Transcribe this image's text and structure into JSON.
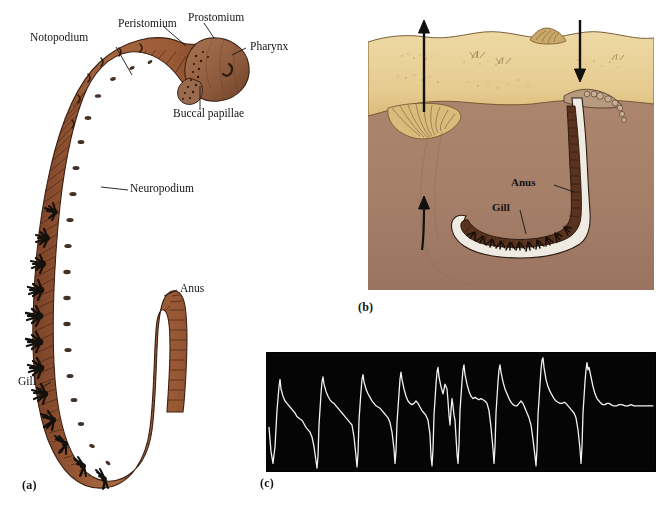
{
  "figure": {
    "background_color": "#ffffff"
  },
  "colors": {
    "worm_body": "#96583a",
    "worm_body_dark": "#6d3c25",
    "worm_body_light": "#b07a55",
    "head_brown": "#9a6a4e",
    "gill_black": "#14100c",
    "sand": "#e8cf96",
    "sand_dark": "#cdae70",
    "subsoil": "#a9826c",
    "subsoil_dark": "#8d6a57",
    "burrow_white": "#efeae2",
    "ink": "#141414",
    "scope_background": "#050505",
    "scope_trace": "#f2f2f2"
  },
  "panel_a": {
    "label": "(a)",
    "callouts": [
      {
        "name": "notopodium",
        "text": "Notopodium"
      },
      {
        "name": "peristomium",
        "text": "Peristomium"
      },
      {
        "name": "prostomium",
        "text": "Prostomium"
      },
      {
        "name": "pharynx",
        "text": "Pharynx"
      },
      {
        "name": "buccal-papillae",
        "text": "Buccal papillae"
      },
      {
        "name": "neuropodium",
        "text": "Neuropodium"
      },
      {
        "name": "anus",
        "text": "Anus"
      },
      {
        "name": "gill",
        "text": "Gill"
      }
    ]
  },
  "panel_b": {
    "label": "(b)",
    "callouts": [
      {
        "name": "anus",
        "text": "Anus"
      },
      {
        "name": "gill",
        "text": "Gill"
      }
    ],
    "arrows": [
      {
        "name": "water-out-arrow",
        "direction": "up",
        "description": "water expelled at tail shaft"
      },
      {
        "name": "water-in-arrow",
        "direction": "down",
        "description": "water drawn down head shaft"
      },
      {
        "name": "burrow-flow-arrow",
        "direction": "up",
        "description": "flow through sediment"
      }
    ],
    "surface_features": [
      {
        "name": "feeding-funnel",
        "text": ""
      },
      {
        "name": "faecal-cast",
        "text": ""
      }
    ]
  },
  "panel_c": {
    "label": "(c)",
    "description": "Oscilloscope recording of rhythmic irrigation pressure pulses"
  },
  "chart_data": {
    "type": "line",
    "title": "",
    "xlabel": "",
    "ylabel": "",
    "grid": false,
    "legend": null,
    "xlim": [
      0,
      390
    ],
    "ylim": [
      0,
      100
    ],
    "series": [
      {
        "name": "irrigation-pressure-trace",
        "color": "#f2f2f2",
        "points": [
          [
            2,
            38
          ],
          [
            4,
            18
          ],
          [
            6,
            8
          ],
          [
            8,
            22
          ],
          [
            10,
            52
          ],
          [
            12,
            72
          ],
          [
            13,
            78
          ],
          [
            14,
            70
          ],
          [
            16,
            64
          ],
          [
            18,
            60
          ],
          [
            20,
            58
          ],
          [
            23,
            55
          ],
          [
            26,
            52
          ],
          [
            28,
            50
          ],
          [
            30,
            47
          ],
          [
            33,
            45
          ],
          [
            35,
            44
          ],
          [
            37,
            41
          ],
          [
            39,
            38
          ],
          [
            41,
            36
          ],
          [
            43,
            34
          ],
          [
            45,
            30
          ],
          [
            47,
            22
          ],
          [
            49,
            10
          ],
          [
            50,
            4
          ],
          [
            51,
            14
          ],
          [
            52,
            40
          ],
          [
            54,
            66
          ],
          [
            55,
            76
          ],
          [
            56,
            80
          ],
          [
            57,
            74
          ],
          [
            59,
            68
          ],
          [
            61,
            64
          ],
          [
            63,
            61
          ],
          [
            65,
            59
          ],
          [
            67,
            58
          ],
          [
            69,
            56
          ],
          [
            71,
            54
          ],
          [
            73,
            52
          ],
          [
            75,
            50
          ],
          [
            77,
            48
          ],
          [
            79,
            46
          ],
          [
            81,
            44
          ],
          [
            83,
            42
          ],
          [
            85,
            40
          ],
          [
            87,
            30
          ],
          [
            89,
            14
          ],
          [
            90,
            5
          ],
          [
            91,
            16
          ],
          [
            92,
            44
          ],
          [
            94,
            68
          ],
          [
            95,
            78
          ],
          [
            96,
            82
          ],
          [
            97,
            76
          ],
          [
            99,
            70
          ],
          [
            101,
            66
          ],
          [
            103,
            63
          ],
          [
            105,
            60
          ],
          [
            107,
            58
          ],
          [
            109,
            56
          ],
          [
            111,
            55
          ],
          [
            113,
            54
          ],
          [
            115,
            52
          ],
          [
            117,
            50
          ],
          [
            119,
            48
          ],
          [
            121,
            46
          ],
          [
            123,
            42
          ],
          [
            125,
            34
          ],
          [
            127,
            20
          ],
          [
            128,
            8
          ],
          [
            129,
            18
          ],
          [
            130,
            42
          ],
          [
            132,
            66
          ],
          [
            133,
            78
          ],
          [
            134,
            84
          ],
          [
            135,
            78
          ],
          [
            137,
            70
          ],
          [
            139,
            64
          ],
          [
            141,
            60
          ],
          [
            143,
            58
          ],
          [
            145,
            57
          ],
          [
            147,
            58
          ],
          [
            149,
            60
          ],
          [
            151,
            58
          ],
          [
            153,
            55
          ],
          [
            155,
            52
          ],
          [
            157,
            50
          ],
          [
            159,
            48
          ],
          [
            161,
            44
          ],
          [
            163,
            32
          ],
          [
            164,
            14
          ],
          [
            165,
            6
          ],
          [
            166,
            20
          ],
          [
            167,
            48
          ],
          [
            169,
            74
          ],
          [
            170,
            84
          ],
          [
            171,
            88
          ],
          [
            172,
            80
          ],
          [
            174,
            72
          ],
          [
            176,
            66
          ],
          [
            177,
            70
          ],
          [
            178,
            74
          ],
          [
            180,
            70
          ],
          [
            181,
            60
          ],
          [
            182,
            48
          ],
          [
            183,
            40
          ],
          [
            184,
            52
          ],
          [
            185,
            62
          ],
          [
            186,
            56
          ],
          [
            187,
            48
          ],
          [
            188,
            44
          ],
          [
            189,
            30
          ],
          [
            190,
            16
          ],
          [
            191,
            8
          ],
          [
            192,
            24
          ],
          [
            193,
            52
          ],
          [
            195,
            76
          ],
          [
            196,
            86
          ],
          [
            197,
            90
          ],
          [
            198,
            82
          ],
          [
            200,
            74
          ],
          [
            202,
            68
          ],
          [
            204,
            64
          ],
          [
            206,
            62
          ],
          [
            208,
            63
          ],
          [
            210,
            62
          ],
          [
            212,
            61
          ],
          [
            214,
            62
          ],
          [
            216,
            61
          ],
          [
            218,
            60
          ],
          [
            220,
            58
          ],
          [
            222,
            52
          ],
          [
            224,
            38
          ],
          [
            226,
            20
          ],
          [
            227,
            8
          ],
          [
            228,
            22
          ],
          [
            229,
            50
          ],
          [
            231,
            76
          ],
          [
            232,
            86
          ],
          [
            233,
            90
          ],
          [
            234,
            84
          ],
          [
            236,
            76
          ],
          [
            238,
            70
          ],
          [
            240,
            66
          ],
          [
            242,
            62
          ],
          [
            244,
            59
          ],
          [
            246,
            57
          ],
          [
            248,
            56
          ],
          [
            250,
            56
          ],
          [
            252,
            58
          ],
          [
            254,
            60
          ],
          [
            256,
            58
          ],
          [
            258,
            54
          ],
          [
            260,
            50
          ],
          [
            262,
            46
          ],
          [
            264,
            40
          ],
          [
            266,
            28
          ],
          [
            268,
            14
          ],
          [
            269,
            6
          ],
          [
            270,
            20
          ],
          [
            271,
            48
          ],
          [
            273,
            74
          ],
          [
            274,
            86
          ],
          [
            275,
            94
          ],
          [
            276,
            96
          ],
          [
            277,
            88
          ],
          [
            279,
            78
          ],
          [
            281,
            72
          ],
          [
            283,
            68
          ],
          [
            285,
            65
          ],
          [
            287,
            62
          ],
          [
            289,
            60
          ],
          [
            291,
            59
          ],
          [
            293,
            58
          ],
          [
            295,
            58
          ],
          [
            297,
            59
          ],
          [
            299,
            58
          ],
          [
            301,
            56
          ],
          [
            303,
            54
          ],
          [
            305,
            52
          ],
          [
            307,
            50
          ],
          [
            309,
            46
          ],
          [
            311,
            36
          ],
          [
            313,
            20
          ],
          [
            314,
            8
          ],
          [
            315,
            22
          ],
          [
            316,
            50
          ],
          [
            318,
            76
          ],
          [
            319,
            86
          ],
          [
            320,
            92
          ],
          [
            321,
            86
          ],
          [
            322,
            88
          ],
          [
            324,
            80
          ],
          [
            326,
            72
          ],
          [
            328,
            66
          ],
          [
            330,
            62
          ],
          [
            332,
            60
          ],
          [
            334,
            58
          ],
          [
            336,
            57
          ],
          [
            338,
            57
          ],
          [
            340,
            58
          ],
          [
            342,
            58
          ],
          [
            344,
            57
          ],
          [
            346,
            56
          ],
          [
            348,
            56
          ],
          [
            350,
            56
          ],
          [
            352,
            57
          ],
          [
            355,
            57
          ],
          [
            358,
            56
          ],
          [
            361,
            56
          ],
          [
            364,
            57
          ],
          [
            367,
            56
          ],
          [
            370,
            56
          ],
          [
            374,
            56
          ],
          [
            378,
            56
          ],
          [
            382,
            56
          ],
          [
            386,
            56
          ]
        ]
      }
    ]
  }
}
